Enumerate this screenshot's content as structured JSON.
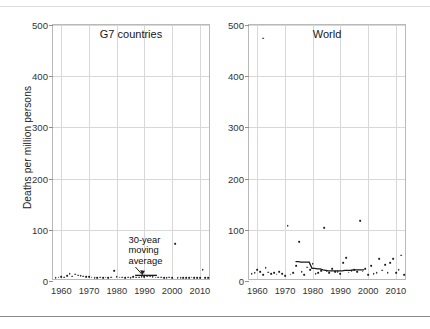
{
  "figure": {
    "ylabel": "Deaths per million persons",
    "ylim": [
      0,
      500
    ],
    "xlim": [
      1957,
      2014
    ],
    "yticks": [
      0,
      100,
      200,
      300,
      400,
      500
    ],
    "ytick_labels": [
      "0",
      "100",
      "200",
      "300",
      "400",
      "500"
    ],
    "xticks": [
      1960,
      1970,
      1980,
      1990,
      2000,
      2010
    ],
    "xtick_labels": [
      "1960",
      "1970",
      "1980",
      "1990",
      "2000",
      "2010"
    ],
    "grid": "both",
    "legend": "none",
    "colors": {
      "marker": "#1b1b1b",
      "line": "#1b1b1b",
      "grid": "#d8d8d8",
      "axis": "#b9b9b9",
      "text": "#1a1a1a"
    },
    "annotation": {
      "line1": "30-year",
      "line2": "moving",
      "line3": "average"
    }
  },
  "chart_data": [
    {
      "type": "scatter",
      "title": "G7 countries",
      "xlabel": "",
      "ylabel": "Deaths per million persons",
      "xlim": [
        1957,
        2014
      ],
      "ylim": [
        0,
        500
      ],
      "grid": true,
      "legend": "none",
      "series": [
        {
          "name": "Annual deaths per million persons",
          "type": "scatter",
          "x": [
            1958,
            1959,
            1960,
            1961,
            1962,
            1963,
            1964,
            1965,
            1966,
            1967,
            1968,
            1969,
            1970,
            1971,
            1972,
            1973,
            1974,
            1975,
            1976,
            1977,
            1978,
            1979,
            1980,
            1981,
            1982,
            1983,
            1984,
            1985,
            1986,
            1987,
            1988,
            1989,
            1990,
            1991,
            1992,
            1993,
            1994,
            1995,
            1996,
            1997,
            1998,
            1999,
            2000,
            2001,
            2002,
            2003,
            2004,
            2005,
            2006,
            2007,
            2008,
            2009,
            2010,
            2011,
            2012,
            2013
          ],
          "y": [
            2,
            3,
            4,
            3,
            6,
            10,
            5,
            9,
            7,
            6,
            5,
            4,
            4,
            3,
            2,
            2,
            3,
            2,
            3,
            2,
            3,
            16,
            4,
            3,
            3,
            2,
            3,
            2,
            4,
            3,
            3,
            4,
            4,
            5,
            5,
            4,
            3,
            3,
            3,
            2,
            2,
            3,
            2,
            69,
            2,
            2,
            2,
            2,
            2,
            3,
            2,
            2,
            2,
            18,
            2,
            2
          ]
        },
        {
          "name": "30-year moving average",
          "type": "line",
          "x": [
            1987,
            1988,
            1989,
            1990,
            1991,
            1992,
            1993,
            1994,
            1995
          ],
          "y": [
            6,
            6,
            6,
            6,
            6,
            6,
            6,
            6,
            6
          ]
        }
      ],
      "annotations": [
        {
          "text": "30-year moving average",
          "x": 1990,
          "y": 78,
          "arrow_to_x": 1990,
          "arrow_to_y": 10
        }
      ]
    },
    {
      "type": "scatter",
      "title": "World",
      "xlabel": "",
      "ylabel": "",
      "xlim": [
        1957,
        2014
      ],
      "ylim": [
        0,
        500
      ],
      "grid": true,
      "legend": "none",
      "series": [
        {
          "name": "Annual deaths per million persons",
          "type": "scatter",
          "x": [
            1958,
            1959,
            1960,
            1961,
            1962,
            1963,
            1964,
            1965,
            1966,
            1967,
            1968,
            1969,
            1970,
            1971,
            1972,
            1973,
            1974,
            1975,
            1976,
            1977,
            1978,
            1979,
            1980,
            1981,
            1982,
            1983,
            1984,
            1985,
            1986,
            1987,
            1988,
            1989,
            1990,
            1991,
            1992,
            1993,
            1994,
            1995,
            1996,
            1997,
            1998,
            1999,
            2000,
            2001,
            2002,
            2003,
            2004,
            2005,
            2006,
            2007,
            2008,
            2009,
            2010,
            2011,
            2012,
            2013
          ],
          "y": [
            10,
            12,
            18,
            14,
            8,
            22,
            13,
            10,
            12,
            9,
            14,
            10,
            6,
            104,
            9,
            12,
            26,
            72,
            14,
            8,
            23,
            18,
            30,
            10,
            12,
            16,
            100,
            16,
            12,
            20,
            14,
            14,
            10,
            32,
            42,
            13,
            16,
            18,
            14,
            114,
            15,
            20,
            8,
            26,
            10,
            12,
            40,
            17,
            28,
            12,
            32,
            40,
            12,
            18,
            46,
            8
          ]
        },
        {
          "name": "Isolated high outlier",
          "type": "scatter",
          "x": [
            1962
          ],
          "y": [
            470
          ]
        },
        {
          "name": "30-year moving average",
          "type": "line",
          "x": [
            1974,
            1975,
            1976,
            1977,
            1978,
            1979,
            1980,
            1981,
            1982,
            1983,
            1984,
            1985,
            1986,
            1987,
            1988,
            1989,
            1990,
            1991,
            1992,
            1993,
            1994,
            1995,
            1996,
            1997,
            1998,
            1999
          ],
          "y": [
            33,
            33,
            32,
            32,
            32,
            32,
            20,
            20,
            19,
            19,
            17,
            16,
            15,
            15,
            15,
            15,
            15,
            15,
            16,
            16,
            16,
            17,
            17,
            17,
            17,
            17
          ]
        }
      ],
      "annotations": []
    }
  ]
}
